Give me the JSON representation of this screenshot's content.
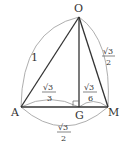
{
  "figure": {
    "vertices": {
      "O": {
        "label": "O",
        "x": 79,
        "y": 17
      },
      "A": {
        "label": "A",
        "x": 21,
        "y": 107
      },
      "G": {
        "label": "G",
        "x": 79,
        "y": 107
      },
      "M": {
        "label": "M",
        "x": 108,
        "y": 107
      }
    },
    "lengths": {
      "OA": {
        "value": "1"
      },
      "OM": {
        "num": "√3",
        "den": "2"
      },
      "AG": {
        "num": "√3",
        "den": "3"
      },
      "GM": {
        "num": "√3",
        "den": "6"
      },
      "AM": {
        "num": "√3",
        "den": "2"
      }
    },
    "right_angle_at": "G",
    "colors": {
      "line": "#333333",
      "arc": "#999999"
    }
  }
}
